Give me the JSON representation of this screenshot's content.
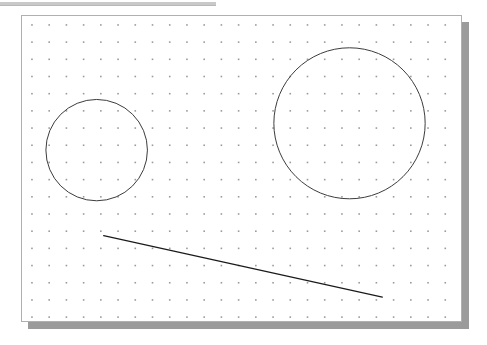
{
  "window": {
    "title": "Dot Grid Canvas",
    "top_rule": {
      "x": 0,
      "y": 2,
      "width": 216,
      "height": 3,
      "color": "#c9c9c9"
    }
  },
  "canvas": {
    "name": "drawing-canvas",
    "x": 21,
    "y": 15,
    "width": 441,
    "height": 307,
    "background": "#ffffff",
    "border_color": "#b0b0b0",
    "shadow": {
      "offset_x": 7,
      "offset_y": 7,
      "color": "#9b9b9b"
    }
  },
  "grid": {
    "type": "dots",
    "spacing_x": 17.3,
    "spacing_y": 17.3,
    "origin_x": 10,
    "origin_y": 9,
    "dot_size": 1.6,
    "dot_color": "#9a9a9a",
    "columns": 26,
    "rows": 18
  },
  "shapes": [
    {
      "id": "small-circle",
      "type": "circle",
      "label": "Small circle",
      "cx": 96,
      "cy": 150,
      "r": 51,
      "canvas_cx": 75,
      "canvas_cy": 135,
      "stroke": "#3a3a3a",
      "stroke_width": 1,
      "fill": "none"
    },
    {
      "id": "large-circle",
      "type": "circle",
      "label": "Large circle",
      "cx": 350,
      "cy": 123,
      "r": 76,
      "canvas_cx": 329,
      "canvas_cy": 108,
      "stroke": "#3a3a3a",
      "stroke_width": 1,
      "fill": "none"
    },
    {
      "id": "diagonal-line",
      "type": "line",
      "label": "Diagonal line",
      "x1": 103,
      "y1": 236,
      "x2": 383,
      "y2": 298,
      "canvas_x1": 82,
      "canvas_y1": 221,
      "canvas_x2": 362,
      "canvas_y2": 283,
      "stroke": "#1a1a1a",
      "stroke_width": 1.2
    }
  ],
  "chart_data": {
    "type": "scatter",
    "title": "",
    "xlabel": "",
    "ylabel": "",
    "grid": true,
    "annotations": [
      "circle center (96, 150) radius 51",
      "circle center (350, 123) radius 76",
      "line from (103, 236) to (383, 298)"
    ]
  }
}
